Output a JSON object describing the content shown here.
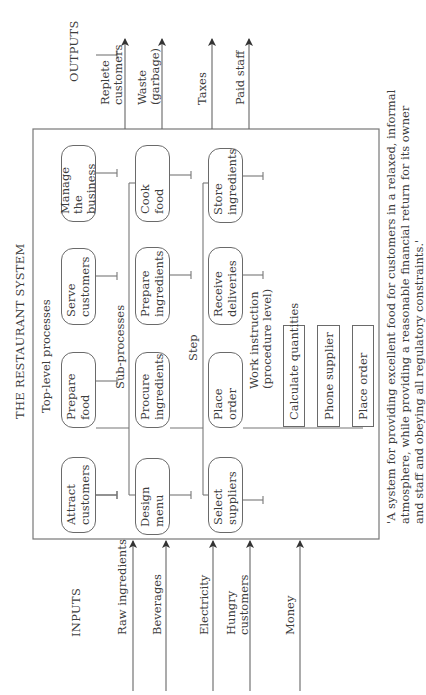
{
  "title": "THE RESTAURANT SYSTEM",
  "inputs": {
    "heading": "INPUTS",
    "items": [
      {
        "label": "Raw ingredients"
      },
      {
        "label": "Beverages"
      },
      {
        "label": "Electricity"
      },
      {
        "label": "Hungry customers",
        "line1": "Hungry",
        "line2": "customers"
      },
      {
        "label": "Money"
      }
    ]
  },
  "outputs": {
    "heading": "OUTPUTS",
    "items": [
      {
        "label": "Replete customers",
        "line1": "Replete",
        "line2": "customers"
      },
      {
        "label": "Waste (garbage)",
        "line1": "Waste",
        "line2": "(garbage)"
      },
      {
        "label": "Taxes"
      },
      {
        "label": "Paid staff"
      }
    ]
  },
  "levels": {
    "top_level": {
      "label": "Top-level processes",
      "nodes": [
        {
          "line1": "Attract",
          "line2": "customers"
        },
        {
          "line1": "Prepare",
          "line2": "food"
        },
        {
          "line1": "Serve",
          "line2": "customers"
        },
        {
          "line1": "Manage",
          "line2": "the business"
        }
      ]
    },
    "sub_processes": {
      "label": "Sub-processes",
      "nodes": [
        {
          "line1": "Design",
          "line2": "menu"
        },
        {
          "line1": "Procure",
          "line2": "ingredients"
        },
        {
          "line1": "Prepare",
          "line2": "ingredients"
        },
        {
          "line1": "Cook",
          "line2": "food"
        }
      ]
    },
    "step": {
      "label": "Step",
      "nodes": [
        {
          "line1": "Select",
          "line2": "suppliers"
        },
        {
          "line1": "Place",
          "line2": "order"
        },
        {
          "line1": "Receive",
          "line2": "deliveries"
        },
        {
          "line1": "Store",
          "line2": "ingredients"
        }
      ]
    },
    "work_instruction": {
      "label_line1": "Work instruction",
      "label_line2": "(procedure level)",
      "items": [
        "Calculate quantities",
        "Phone supplier",
        "Place order"
      ]
    }
  },
  "caption": {
    "line1": "'A system for providing excellent food for customers in a relaxed, informal",
    "line2": "atmosphere, while providing a reasonable financial return for its owner",
    "line3": "and staff and obeying all regulatory constraints.'"
  }
}
